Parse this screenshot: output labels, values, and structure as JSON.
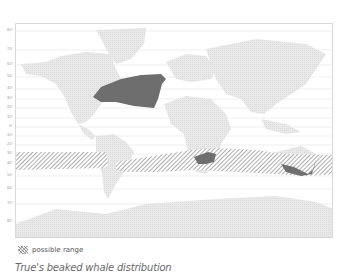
{
  "map": {
    "title": "True's beaked whale distribution",
    "legend": {
      "possible_range_label": "possible range"
    },
    "latitude_labels": [
      {
        "label": "80°",
        "y": 30
      },
      {
        "label": "70°",
        "y": 49
      },
      {
        "label": "60°",
        "y": 64
      },
      {
        "label": "50°",
        "y": 76
      },
      {
        "label": "40°",
        "y": 88
      },
      {
        "label": "30°",
        "y": 98
      },
      {
        "label": "20°",
        "y": 107
      },
      {
        "label": "10°",
        "y": 117
      },
      {
        "label": "0°",
        "y": 126
      },
      {
        "label": "10°",
        "y": 135
      },
      {
        "label": "20°",
        "y": 144
      },
      {
        "label": "30°",
        "y": 153
      },
      {
        "label": "40°",
        "y": 163
      },
      {
        "label": "50°",
        "y": 175
      },
      {
        "label": "60°",
        "y": 188
      },
      {
        "label": "70°",
        "y": 203
      },
      {
        "label": "80°",
        "y": 221
      }
    ],
    "colors": {
      "land": "#e6e6e6",
      "known_range": "#6e6e6e",
      "hatch": "#8a8a8a",
      "gridline": "#e2e2e2",
      "frame": "#d8d8d8"
    },
    "regions": [
      {
        "name": "North Atlantic",
        "type": "known range"
      },
      {
        "name": "South Africa",
        "type": "known range"
      },
      {
        "name": "South Australia",
        "type": "known range"
      },
      {
        "name": "Southern Hemisphere band",
        "type": "possible range"
      }
    ]
  }
}
